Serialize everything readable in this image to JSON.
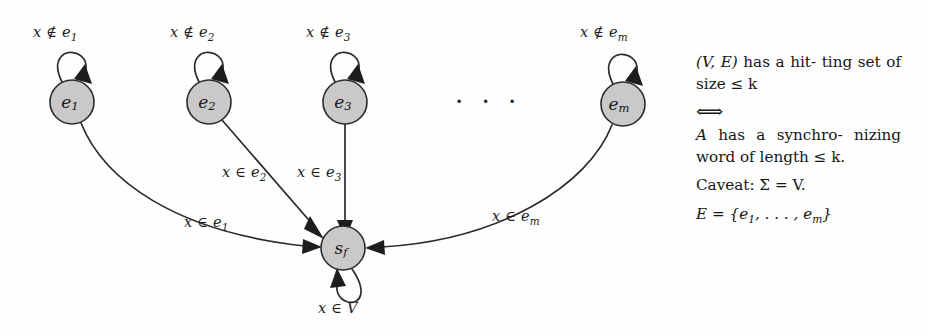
{
  "figure": {
    "background_color": "#fefefe",
    "node_fill_color": "#c9c9c9",
    "stroke_color": "#2b2b2b"
  },
  "nodes": [
    {
      "id": "e1",
      "label_base": "e",
      "label_sub": "1",
      "cx": 72,
      "cy": 102,
      "r": 22
    },
    {
      "id": "e2",
      "label_base": "e",
      "label_sub": "2",
      "cx": 209,
      "cy": 102,
      "r": 22
    },
    {
      "id": "e3",
      "label_base": "e",
      "label_sub": "3",
      "cx": 345,
      "cy": 102,
      "r": 22
    },
    {
      "id": "em",
      "label_base": "e",
      "label_sub": "m",
      "cx": 623,
      "cy": 104,
      "r": 22
    },
    {
      "id": "sf",
      "label_base": "s",
      "label_sub": "f",
      "cx": 343,
      "cy": 248,
      "r": 22
    }
  ],
  "ellipsis": {
    "text": "· · ·",
    "x": 455,
    "y": 88
  },
  "self_loop_labels": [
    {
      "id": "loop-e1",
      "prefix": "x ∉ e",
      "sub": "1",
      "x": 33,
      "y": 24
    },
    {
      "id": "loop-e2",
      "prefix": "x ∉ e",
      "sub": "2",
      "x": 170,
      "y": 24
    },
    {
      "id": "loop-e3",
      "prefix": "x ∉ e",
      "sub": "3",
      "x": 306,
      "y": 24
    },
    {
      "id": "loop-em",
      "prefix": "x ∉ e",
      "sub": "m",
      "x": 580,
      "y": 24
    }
  ],
  "transition_labels": [
    {
      "id": "trans-e1-sf",
      "prefix": "x ∈ e",
      "sub": "1",
      "x": 184,
      "y": 214
    },
    {
      "id": "trans-e2-sf",
      "prefix": "x ∈ e",
      "sub": "2",
      "x": 222,
      "y": 164
    },
    {
      "id": "trans-e3-sf",
      "prefix": "x ∈ e",
      "sub": "3",
      "x": 297,
      "y": 164
    },
    {
      "id": "trans-em-sf",
      "prefix": "x ∈ e",
      "sub": "m",
      "x": 492,
      "y": 208
    },
    {
      "id": "trans-sf-loop",
      "prefix": "x ∈ V",
      "sub": "",
      "x": 318,
      "y": 300
    }
  ],
  "side_text": {
    "statement_top": "(V, E) has a hit­ting set of size ≤ k",
    "statement_top_parts": {
      "lead": "(V, E)",
      "rest": "has a hit-",
      "line2": "ting set of size ≤ k"
    },
    "equivalence_symbol": "⟺",
    "statement_bottom_parts": {
      "lead": "A",
      "rest": "has a synchro-",
      "line2": "nizing      word      of",
      "line3": "length ≤ k."
    },
    "caveat": "Caveat: Σ = V.",
    "edge_set": "E = {e₁, . . . , eₘ}",
    "edge_set_parts": {
      "lhs": "E = {e",
      "sub1": "1",
      "mid": ", . . . , e",
      "sub2": "m",
      "close": "}"
    }
  }
}
